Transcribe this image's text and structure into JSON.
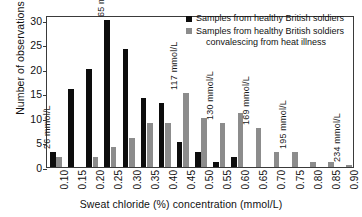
{
  "chart_data": {
    "type": "bar",
    "title": "",
    "xlabel": "Sweat chloride (%) concentration (mmol/L)",
    "ylabel": "Number of observations",
    "ylim": [
      0,
      31
    ],
    "yticks": [
      0,
      5,
      10,
      15,
      20,
      25,
      30
    ],
    "grid": false,
    "legend_position": "top-right",
    "categories": [
      "0.10",
      "0.15",
      "0.20",
      "0.25",
      "0.30",
      "0.35",
      "0.40",
      "0.45",
      "0.50",
      "0.55",
      "0.60",
      "0.65",
      "0.70",
      "0.75",
      "0.80",
      "0.85",
      "0.90"
    ],
    "series": [
      {
        "name": "Samples from healthy British soldiers",
        "color": "#0d0d0d",
        "values": [
          3,
          16,
          20,
          30,
          24,
          14,
          13,
          5,
          3,
          1,
          2,
          0,
          0,
          0,
          0,
          0,
          0
        ]
      },
      {
        "name": "Samples from healthy British soldiers convalescing from heat illness",
        "color": "#8c8c8c",
        "values": [
          2,
          0,
          2,
          4,
          6,
          9,
          9,
          15,
          10,
          9,
          11,
          8,
          3,
          3,
          1,
          1,
          0.5
        ]
      }
    ],
    "annotations": [
      {
        "category": "0.10",
        "text": "26 mmol/L"
      },
      {
        "category": "0.25",
        "text": "65 mmol/L"
      },
      {
        "category": "0.45",
        "text": "117 mmol/L"
      },
      {
        "category": "0.55",
        "text": "130 mmol/L"
      },
      {
        "category": "0.65",
        "text": "169 mmol/L"
      },
      {
        "category": "0.75",
        "text": "195 mmol/L"
      },
      {
        "category": "0.90",
        "text": "234 mmol/L"
      }
    ]
  },
  "legend": {
    "entries": [
      {
        "label": "Samples from healthy British soldiers",
        "label2": ""
      },
      {
        "label": "Samples from healthy British soldiers",
        "label2": "convalescing from heat illness"
      }
    ]
  },
  "axes": {
    "y_title": "Number of observations",
    "x_title": "Sweat chloride (%) concentration (mmol/L)"
  }
}
